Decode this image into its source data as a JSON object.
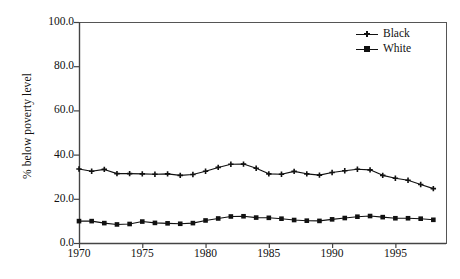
{
  "chart_data": {
    "type": "line",
    "title": "",
    "subtitle": "",
    "xlabel": "",
    "ylabel": "% below poverty level",
    "xlim": [
      1970,
      1999
    ],
    "ylim": [
      0.0,
      100.0
    ],
    "grid": false,
    "legend_position": "top-right",
    "x": [
      1970,
      1971,
      1972,
      1973,
      1974,
      1975,
      1976,
      1977,
      1978,
      1979,
      1980,
      1981,
      1982,
      1983,
      1984,
      1985,
      1986,
      1987,
      1988,
      1989,
      1990,
      1991,
      1992,
      1993,
      1994,
      1995,
      1996,
      1997,
      1998
    ],
    "xticks": [
      1970,
      1975,
      1980,
      1985,
      1990,
      1995
    ],
    "xtick_labels": [
      "1970",
      "1975",
      "1980",
      "1985",
      "1990",
      "1995"
    ],
    "yticks": [
      0.0,
      20.0,
      40.0,
      60.0,
      80.0,
      100.0
    ],
    "ytick_labels": [
      "0.0",
      "20.0",
      "40.0",
      "60.0",
      "80.0",
      "100.0"
    ],
    "series": [
      {
        "name": "Black",
        "marker": "cross",
        "color": "#111111",
        "values": [
          33.5,
          32.5,
          33.3,
          31.4,
          31.4,
          31.3,
          31.1,
          31.3,
          30.6,
          31.0,
          32.5,
          34.2,
          35.6,
          35.7,
          33.8,
          31.3,
          31.1,
          32.4,
          31.3,
          30.7,
          31.9,
          32.7,
          33.4,
          33.1,
          30.6,
          29.3,
          28.4,
          26.5,
          24.6
        ]
      },
      {
        "name": "White",
        "marker": "square",
        "color": "#111111",
        "values": [
          9.9,
          9.9,
          9.0,
          8.4,
          8.6,
          9.7,
          9.1,
          8.9,
          8.7,
          9.0,
          10.2,
          11.1,
          12.0,
          12.1,
          11.5,
          11.4,
          11.0,
          10.4,
          10.1,
          10.0,
          10.7,
          11.3,
          11.9,
          12.2,
          11.7,
          11.2,
          11.2,
          11.0,
          10.5
        ]
      }
    ]
  },
  "axes": {
    "frame": {
      "left": 79,
      "top": 22,
      "right": 446,
      "bottom": 243
    }
  }
}
